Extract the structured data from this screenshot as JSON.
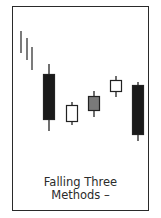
{
  "caption": {
    "line1": "Falling Three",
    "line2": "Methods –"
  },
  "colors": {
    "frame": "#2a2a2a",
    "bearish": "#1a1a1a",
    "bullish": "#ffffff",
    "neutral": "#7a7a7a",
    "trend": "#333333"
  },
  "trend_lines": [
    {
      "x": 21,
      "y1": 31,
      "y2": 53
    },
    {
      "x": 27,
      "y1": 38,
      "y2": 60
    },
    {
      "x": 32,
      "y1": 47,
      "y2": 70
    }
  ],
  "candles": [
    {
      "type": "bearish",
      "x": 43,
      "w": 12,
      "body_top": 74,
      "body_bottom": 120,
      "high": 64,
      "low": 131
    },
    {
      "type": "bullish",
      "x": 66,
      "w": 12,
      "body_top": 105,
      "body_bottom": 122,
      "high": 102,
      "low": 125
    },
    {
      "type": "neutral",
      "x": 88,
      "w": 12,
      "body_top": 96,
      "body_bottom": 111,
      "high": 91,
      "low": 117
    },
    {
      "type": "bullish",
      "x": 110,
      "w": 12,
      "body_top": 80,
      "body_bottom": 92,
      "high": 76,
      "low": 97
    },
    {
      "type": "bearish",
      "x": 132,
      "w": 12,
      "body_top": 85,
      "body_bottom": 135,
      "high": 82,
      "low": 141
    }
  ]
}
